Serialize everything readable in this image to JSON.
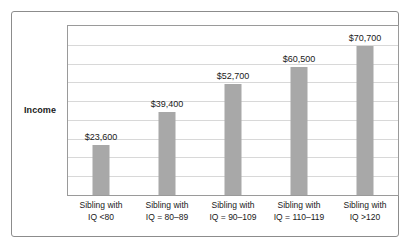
{
  "chart_data": {
    "type": "bar",
    "title": "",
    "subtitle": "",
    "xlabel": "",
    "ylabel": "Income",
    "ylim": [
      0,
      80000
    ],
    "grid": true,
    "gridlines": 8,
    "legend": "none",
    "orientation": "vertical",
    "categories": [
      "Sibling with IQ <80",
      "Sibling with IQ = 80–89",
      "Sibling with IQ = 90–109",
      "Sibling with IQ = 110–119",
      "Sibling with IQ >120"
    ],
    "category_lines": [
      {
        "line1": "Sibling with",
        "line2": "IQ <80"
      },
      {
        "line1": "Sibling with",
        "line2": "IQ = 80–89"
      },
      {
        "line1": "Sibling with",
        "line2": "IQ = 90–109"
      },
      {
        "line1": "Sibling with",
        "line2": "IQ = 110–119"
      },
      {
        "line1": "Sibling with",
        "line2": "IQ >120"
      }
    ],
    "values": [
      23600,
      39400,
      52700,
      60500,
      70700
    ],
    "data_labels": [
      "$23,600",
      "$39,400",
      "$52,700",
      "$60,500",
      "$70,700"
    ],
    "colors": {
      "bar": "#a8a8a8",
      "gridline": "#d8d8d8",
      "plot_border": "#9a9a9a",
      "outer_border": "#8c8c8c",
      "text": "#1a1a1a",
      "background": "#ffffff"
    }
  },
  "axis": {
    "y_title": "Income"
  }
}
